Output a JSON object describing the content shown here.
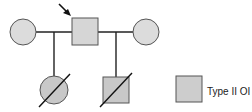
{
  "diagram": {
    "type": "pedigree",
    "colors": {
      "stroke": "#555555",
      "line": "#222222",
      "affected_fill": "#cfcfcf",
      "unaffected_fill": "#dcdcdc",
      "background": "#ffffff"
    },
    "generation_1": [
      {
        "id": "mate-1",
        "sex": "female",
        "shape": "circle",
        "status": "unaffected",
        "shading": "light-gray"
      },
      {
        "id": "proband",
        "sex": "male",
        "shape": "square",
        "status": "unaffected",
        "proband": true,
        "shading": "light-gray"
      },
      {
        "id": "mate-2",
        "sex": "female",
        "shape": "circle",
        "status": "unaffected",
        "shading": "light-gray"
      }
    ],
    "generation_2": [
      {
        "id": "child-1",
        "sex": "female",
        "shape": "circle",
        "status": "affected",
        "deceased": true,
        "parents": [
          "mate-1",
          "proband"
        ]
      },
      {
        "id": "child-2",
        "sex": "male",
        "shape": "square",
        "status": "affected",
        "deceased": true,
        "parents": [
          "proband",
          "mate-2"
        ]
      }
    ]
  },
  "legend": {
    "swatch": "square",
    "label": "Type II OI"
  }
}
